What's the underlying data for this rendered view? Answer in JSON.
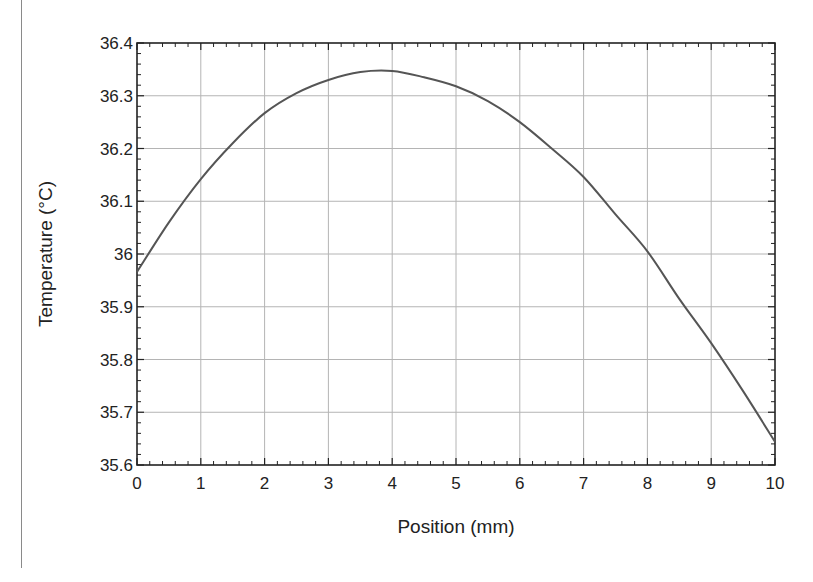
{
  "chart_data": {
    "type": "line",
    "title": "",
    "xlabel": "Position (mm)",
    "ylabel": "Temperature (°C)",
    "xlim": [
      0,
      10
    ],
    "ylim": [
      35.6,
      36.4
    ],
    "x_ticks": [
      "0",
      "1",
      "2",
      "3",
      "4",
      "5",
      "6",
      "7",
      "8",
      "9",
      "10"
    ],
    "y_ticks": [
      "35.6",
      "35.7",
      "35.8",
      "35.9",
      "36",
      "36.1",
      "36.2",
      "36.3",
      "36.4"
    ],
    "grid": true,
    "minor_ticks_per_major": 4,
    "legend": null,
    "series": [
      {
        "name": "Temperature",
        "color": "#555555",
        "x": [
          0,
          0.5,
          1,
          1.5,
          2,
          2.5,
          3,
          3.5,
          4,
          4.5,
          5,
          5.5,
          6,
          6.5,
          7,
          7.5,
          8,
          8.5,
          9,
          9.5,
          10
        ],
        "values": [
          35.966,
          36.06,
          36.142,
          36.21,
          36.267,
          36.305,
          36.33,
          36.345,
          36.347,
          36.335,
          36.318,
          36.29,
          36.25,
          36.2,
          36.146,
          36.075,
          36.005,
          35.915,
          35.831,
          35.74,
          35.644
        ]
      }
    ]
  },
  "colors": {
    "line": "#555555",
    "grid": "#b4b4b4",
    "axis": "#222222",
    "background": "#ffffff"
  }
}
